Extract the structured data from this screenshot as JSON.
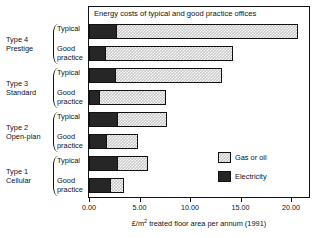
{
  "chart_data": {
    "type": "bar",
    "orientation": "horizontal",
    "stacked": true,
    "title": "Energy costs of typical and good practice offices",
    "xlabel": "£/m² treated floor area per annum (1991)",
    "ylabel": "",
    "xlim": [
      0,
      22
    ],
    "xticks": [
      0,
      5,
      10,
      15,
      20
    ],
    "xtick_labels": [
      "0.00",
      "5.00",
      "10.00",
      "15.00",
      "20.00"
    ],
    "grid": false,
    "legend_position": "inside-lower-right",
    "groups": [
      {
        "name": "Type 4\nPrestige",
        "name_line1": "Type 4",
        "name_line2": "Prestige",
        "bars": [
          {
            "label": "Typical",
            "electricity": 2.8,
            "gas_or_oil": 17.9,
            "total": 20.7
          },
          {
            "label": "Good\npractice",
            "electricity": 1.7,
            "gas_or_oil": 12.6,
            "total": 14.3
          }
        ]
      },
      {
        "name": "Type 3\nStandard",
        "name_line1": "Type 3",
        "name_line2": "Standard",
        "bars": [
          {
            "label": "Typical",
            "electricity": 2.7,
            "gas_or_oil": 10.5,
            "total": 13.2
          },
          {
            "label": "Good\npractice",
            "electricity": 1.1,
            "gas_or_oil": 6.5,
            "total": 7.6
          }
        ]
      },
      {
        "name": "Type 2\nOpen-plan",
        "name_line1": "Type 2",
        "name_line2": "Open-plan",
        "bars": [
          {
            "label": "Typical",
            "electricity": 2.9,
            "gas_or_oil": 4.8,
            "total": 7.7
          },
          {
            "label": "Good\npractice",
            "electricity": 1.8,
            "gas_or_oil": 3.1,
            "total": 4.9
          }
        ]
      },
      {
        "name": "Type 1\nCellular",
        "name_line1": "Type 1",
        "name_line2": "Cellular",
        "bars": [
          {
            "label": "Typical",
            "electricity": 2.9,
            "gas_or_oil": 2.9,
            "total": 5.8
          },
          {
            "label": "Good\npractice",
            "electricity": 2.2,
            "gas_or_oil": 1.3,
            "total": 3.5
          }
        ]
      }
    ],
    "series": [
      {
        "name": "Gas or oil",
        "pattern": "checkered",
        "color": "#c8c8c8"
      },
      {
        "name": "Electricity",
        "pattern": "solid",
        "color": "#262626"
      }
    ]
  },
  "legend": {
    "items": [
      {
        "label": "Gas or oil",
        "swatch": "gas"
      },
      {
        "label": "Electricity",
        "swatch": "elec"
      }
    ]
  },
  "axis": {
    "title_prefix": "£/m",
    "title_sup": "2",
    "title_suffix": " treated floor area per annum (1991)"
  }
}
